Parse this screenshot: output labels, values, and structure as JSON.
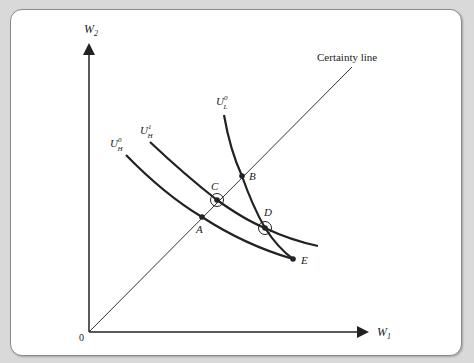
{
  "diagram": {
    "axes": {
      "y_label": "W",
      "y_sub": "2",
      "x_label": "W",
      "x_sub": "1",
      "origin_label": "0"
    },
    "certainty_line": {
      "label": "Certainty line"
    },
    "curves": [
      {
        "id": "U_H0",
        "base": "U",
        "sup": "0",
        "sub": "H"
      },
      {
        "id": "U_H1",
        "base": "U",
        "sup": "1",
        "sub": "H"
      },
      {
        "id": "U_L0",
        "base": "U",
        "sup": "0",
        "sub": "L"
      }
    ],
    "points": [
      {
        "label": "A",
        "circled": false
      },
      {
        "label": "B",
        "circled": false
      },
      {
        "label": "C",
        "circled": true
      },
      {
        "label": "D",
        "circled": true
      },
      {
        "label": "E",
        "circled": false
      }
    ]
  },
  "colors": {
    "background": "#d9d9d9",
    "panel": "#ffffff",
    "ink": "#222222"
  }
}
